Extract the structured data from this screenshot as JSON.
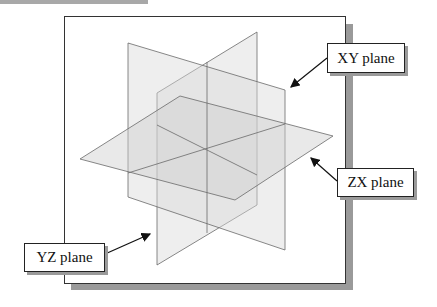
{
  "diagram": {
    "labels": {
      "xy": "XY plane",
      "zx": "ZX plane",
      "yz": "YZ plane"
    },
    "colors": {
      "plane_fill": "#d9d9d9",
      "plane_edge": "#6a6a6a",
      "frame_border": "#333333",
      "shadow": "#9a9a9a"
    }
  }
}
